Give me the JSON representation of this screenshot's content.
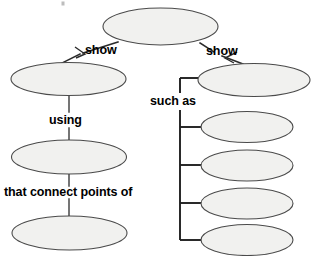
{
  "diagram": {
    "type": "concept-map",
    "title": "",
    "background_color": "#ffffff",
    "node_fill_color": "#f1f1ef",
    "node_stroke_color": "#4a4a4a",
    "link_color": "#2b2b2b",
    "text_color": "#000000",
    "nodes": [
      {
        "id": "n-top",
        "label": "",
        "cx": 160.5,
        "cy": 26.5,
        "rx": 57.5,
        "ry": 18.5
      },
      {
        "id": "n-left-1",
        "label": "",
        "cx": 68.5,
        "cy": 79.0,
        "rx": 57.5,
        "ry": 16.5
      },
      {
        "id": "n-right-main",
        "label": "",
        "cx": 254.0,
        "cy": 80.0,
        "rx": 56.0,
        "ry": 16.5
      },
      {
        "id": "n-left-2",
        "label": "",
        "cx": 69.0,
        "cy": 157.0,
        "rx": 57.5,
        "ry": 17.0
      },
      {
        "id": "n-left-3",
        "label": "",
        "cx": 69.5,
        "cy": 233.0,
        "rx": 57.5,
        "ry": 17.0
      },
      {
        "id": "n-sub-1",
        "label": "",
        "cx": 247.0,
        "cy": 127.0,
        "rx": 46.0,
        "ry": 15.5
      },
      {
        "id": "n-sub-2",
        "label": "",
        "cx": 247.0,
        "cy": 165.5,
        "rx": 46.0,
        "ry": 15.5
      },
      {
        "id": "n-sub-3",
        "label": "",
        "cx": 247.0,
        "cy": 203.5,
        "rx": 46.0,
        "ry": 15.5
      },
      {
        "id": "n-sub-4",
        "label": "",
        "cx": 247.0,
        "cy": 240.0,
        "rx": 46.0,
        "ry": 15.5
      }
    ],
    "edge_labels": {
      "show_left": "show",
      "show_right": "show",
      "such_as": "such as",
      "using": "using",
      "that_connect_points_of": "that connect points of"
    },
    "edges": [
      {
        "from": "n-top",
        "to": "n-left-1",
        "label": "show",
        "style": "arrow"
      },
      {
        "from": "n-top",
        "to": "n-right-main",
        "label": "show",
        "style": "arrow"
      },
      {
        "from": "n-left-1",
        "to": "n-left-2",
        "label": "using",
        "style": "line"
      },
      {
        "from": "n-left-2",
        "to": "n-left-3",
        "label": "that connect points of",
        "style": "line"
      },
      {
        "from": "n-right-main",
        "to": "n-sub-1",
        "label": "such as",
        "style": "bracket"
      },
      {
        "from": "n-right-main",
        "to": "n-sub-2",
        "label": "such as",
        "style": "bracket"
      },
      {
        "from": "n-right-main",
        "to": "n-sub-3",
        "label": "such as",
        "style": "bracket"
      },
      {
        "from": "n-right-main",
        "to": "n-sub-4",
        "label": "such as",
        "style": "bracket"
      }
    ]
  }
}
